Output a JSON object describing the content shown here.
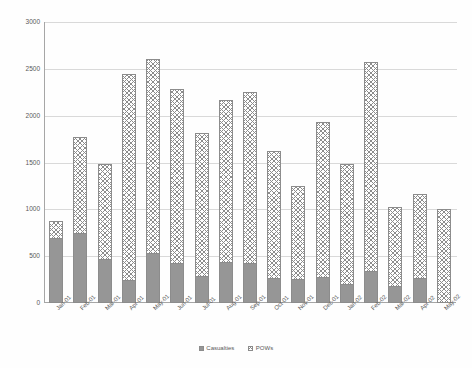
{
  "chart_data": {
    "type": "bar",
    "subtype": "stacked-column",
    "title": "",
    "xlabel": "",
    "ylabel": "",
    "ylim": [
      0,
      3000
    ],
    "ytick_values": [
      0,
      500,
      1000,
      1500,
      2000,
      2500,
      3000
    ],
    "ytick_labels": [
      "0",
      "500",
      "1000",
      "1500",
      "2000",
      "2500",
      "3000"
    ],
    "grid": true,
    "legend_position": "bottom",
    "categories": [
      "Jan-01",
      "Feb-01",
      "Mar-01",
      "Apr-01",
      "May-01",
      "Jun-01",
      "Jul-01",
      "Aug-01",
      "Sep-01",
      "Oct-01",
      "Nov-01",
      "Dec-01",
      "Jan-02",
      "Feb-02",
      "Mar-02",
      "Apr-02",
      "May-02"
    ],
    "series": [
      {
        "name": "Casualties",
        "color": "#969696",
        "pattern": "solid",
        "values": [
          690,
          750,
          470,
          250,
          530,
          430,
          290,
          440,
          430,
          270,
          260,
          280,
          200,
          340,
          180,
          270,
          0
        ]
      },
      {
        "name": "POWs",
        "color": "#ffffff",
        "pattern": "checkerboard",
        "values": [
          190,
          1020,
          1010,
          2200,
          2070,
          1860,
          1530,
          1730,
          1820,
          1350,
          990,
          1650,
          1280,
          2230,
          850,
          890,
          1000
        ]
      }
    ],
    "totals": [
      880,
      1770,
      1480,
      2450,
      2600,
      2290,
      1820,
      2170,
      2250,
      1620,
      1250,
      1930,
      1480,
      2570,
      1030,
      1160,
      1000
    ]
  },
  "legend": {
    "items": [
      {
        "label": "Casualties",
        "swatch": "casualties-swatch"
      },
      {
        "label": "POWs",
        "swatch": "pows-swatch"
      }
    ]
  }
}
